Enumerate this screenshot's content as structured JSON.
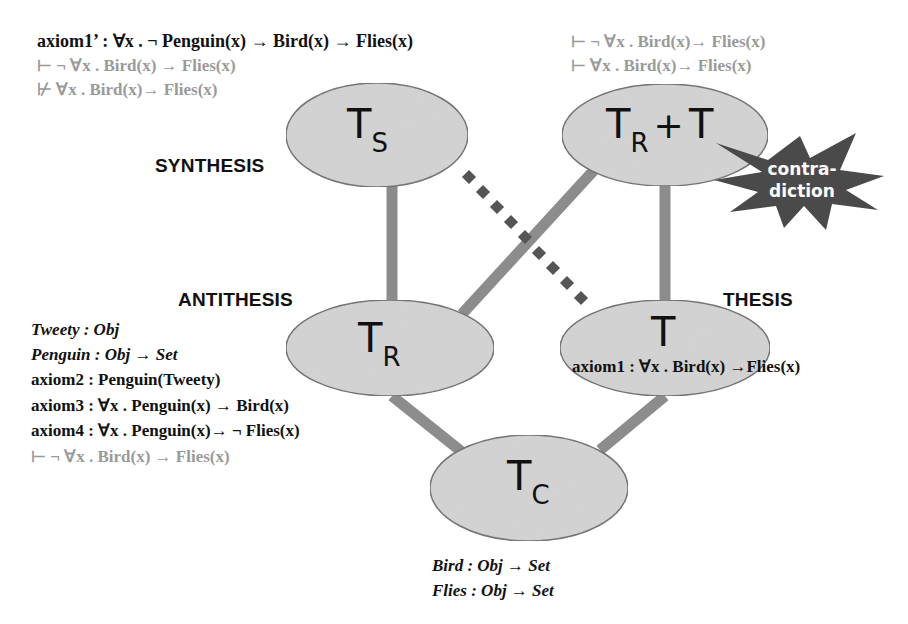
{
  "diagram": {
    "type": "theory-graph",
    "colors": {
      "node_fill": "#d4d4d4",
      "node_stroke": "#6a6a6a",
      "edge_solid": "#8c8c8c",
      "edge_dotted": "#555555",
      "star_fill": "#4a4a4a",
      "text_dark": "#111111",
      "text_grey": "#9a9a9a"
    },
    "roles": {
      "synthesis": "SYNTHESIS",
      "antithesis": "ANTITHESIS",
      "thesis": "THESIS"
    },
    "nodes": {
      "ts": {
        "main": "T",
        "sub": "S"
      },
      "trt": {
        "main": "T",
        "sub": "R",
        "plus": "+",
        "second": "T"
      },
      "tr": {
        "main": "T",
        "sub": "R"
      },
      "t": {
        "main": "T",
        "sub": ""
      },
      "tc": {
        "main": "T",
        "sub": "C"
      }
    },
    "contradiction": {
      "line1": "contra-",
      "line2": "diction"
    },
    "edges": [
      {
        "from": "TS",
        "to": "TR",
        "style": "solid"
      },
      {
        "from": "TS",
        "to": "T",
        "style": "dotted"
      },
      {
        "from": "TR+T",
        "to": "TR",
        "style": "solid"
      },
      {
        "from": "TR+T",
        "to": "T",
        "style": "solid"
      },
      {
        "from": "TR",
        "to": "TC",
        "style": "solid"
      },
      {
        "from": "T",
        "to": "TC",
        "style": "solid"
      }
    ],
    "synthesis_formulas": [
      {
        "text": "axiom1’ : ∀x . ¬ Penguin(x)  → Bird(x) → Flies(x)",
        "tone": "dark"
      },
      {
        "text": "⊢ ¬ ∀x . Bird(x) → Flies(x)",
        "tone": "grey"
      },
      {
        "text": "⊬ ∀x . Bird(x)→ Flies(x)",
        "tone": "grey"
      }
    ],
    "combined_formulas": [
      {
        "text": "⊢ ¬ ∀x . Bird(x)→ Flies(x)",
        "tone": "grey"
      },
      {
        "text": "⊢ ∀x . Bird(x)→ Flies(x)",
        "tone": "grey"
      }
    ],
    "antithesis_formulas": [
      {
        "text": "Tweety : Obj",
        "tone": "dark"
      },
      {
        "text": "Penguin : Obj → Set",
        "tone": "dark"
      },
      {
        "text": "axiom2 : Penguin(Tweety)",
        "tone": "dark"
      },
      {
        "text": "axiom3 : ∀x . Penguin(x) → Bird(x)",
        "tone": "dark"
      },
      {
        "text": "axiom4 : ∀x . Penguin(x)→ ¬ Flies(x)",
        "tone": "dark"
      },
      {
        "text": "⊢ ¬ ∀x . Bird(x) →  Flies(x)",
        "tone": "grey"
      }
    ],
    "thesis_formulas": [
      {
        "text": "axiom1 : ∀x . Bird(x) →Flies(x)",
        "tone": "dark"
      }
    ],
    "common_formulas": [
      {
        "text": "Bird : Obj → Set",
        "tone": "dark"
      },
      {
        "text": "Flies : Obj → Set",
        "tone": "dark"
      }
    ]
  }
}
